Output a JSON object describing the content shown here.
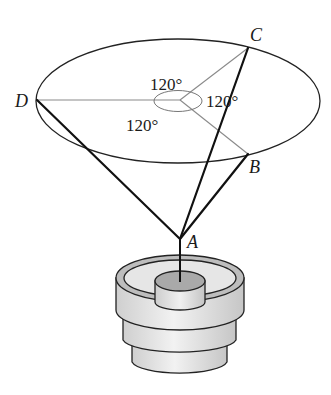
{
  "diagram": {
    "points": {
      "A": {
        "label": "A",
        "x": 180,
        "y": 239
      },
      "B": {
        "label": "B",
        "x": 248,
        "y": 154
      },
      "C": {
        "label": "C",
        "x": 248,
        "y": 48
      },
      "D": {
        "label": "D",
        "x": 37,
        "y": 100
      }
    },
    "center": {
      "x": 180,
      "y": 100
    },
    "angles": [
      {
        "label": "120°",
        "between": "D-C"
      },
      {
        "label": "120°",
        "between": "C-B"
      },
      {
        "label": "120°",
        "between": "B-D"
      }
    ],
    "cables": [
      "AD",
      "AC",
      "AB"
    ],
    "colors": {
      "cable": "#111111",
      "ring": "#222222",
      "radial": "#8a8a8a",
      "base_fill": "#e4e4e4",
      "cylinder_top": "#a9a9a9"
    }
  }
}
